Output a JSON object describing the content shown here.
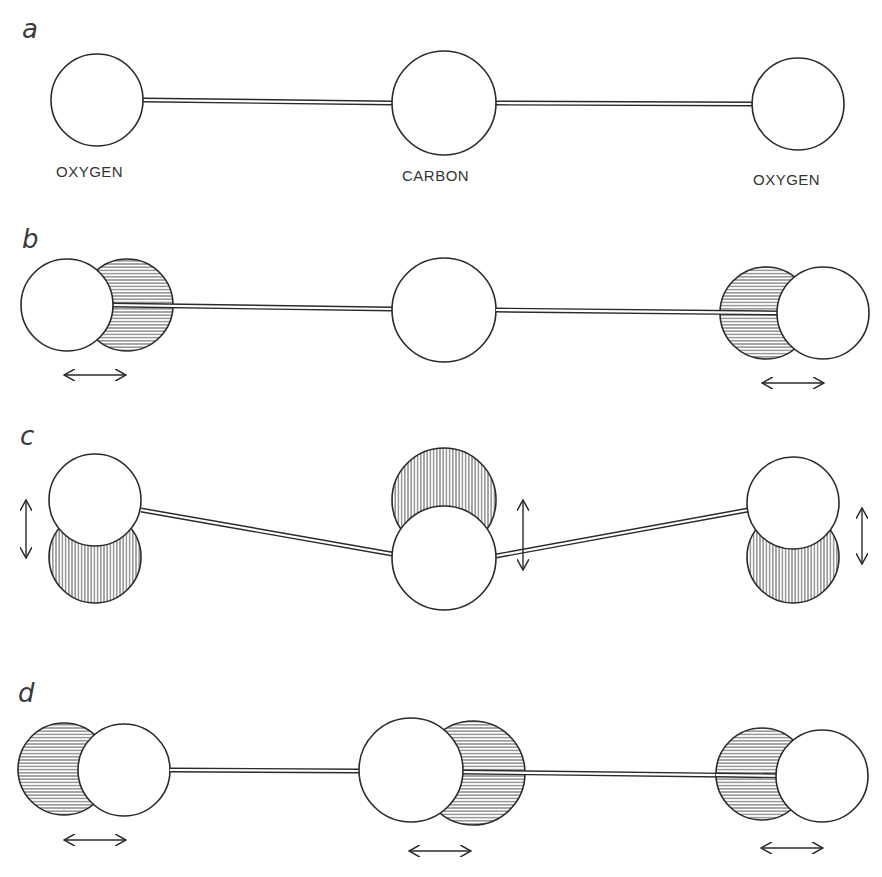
{
  "figure": {
    "colors": {
      "ink": "#2a2a2a",
      "background": "#ffffff",
      "label": "#333333"
    }
  },
  "panels": [
    {
      "letter": "a",
      "mode": "equilibrium",
      "labels": [
        "OXYGEN",
        "CARBON",
        "OXYGEN"
      ]
    },
    {
      "letter": "b",
      "mode": "symmetric-stretch",
      "hatch": "horizontal",
      "arrows": "horizontal"
    },
    {
      "letter": "c",
      "mode": "bending",
      "hatch": "vertical",
      "arrows": "vertical"
    },
    {
      "letter": "d",
      "mode": "asymmetric-stretch",
      "hatch": "horizontal",
      "arrows": "horizontal"
    }
  ]
}
